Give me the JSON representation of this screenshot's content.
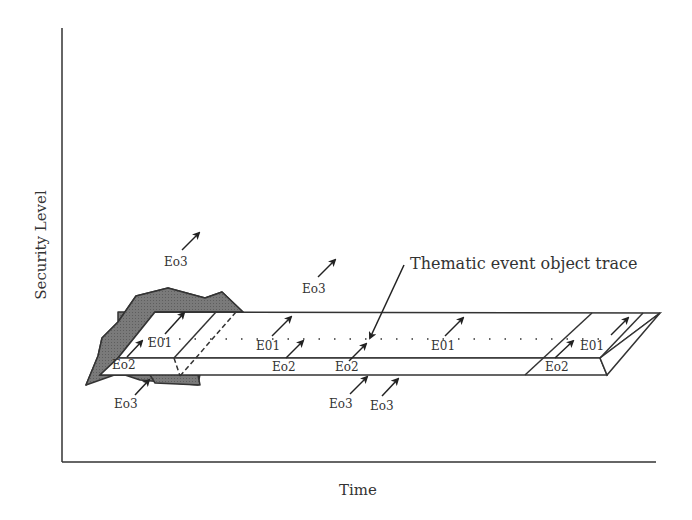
{
  "diagram": {
    "axes": {
      "y_label": "Security Level",
      "x_label": "Time"
    },
    "annotation": {
      "label": "Thematic event object trace"
    },
    "event_labels": [
      {
        "id": "e01-a",
        "text": "E01"
      },
      {
        "id": "e01-b",
        "text": "E01"
      },
      {
        "id": "e01-c",
        "text": "E01"
      },
      {
        "id": "e01-d",
        "text": "E01"
      },
      {
        "id": "eo2-a",
        "text": "Eo2"
      },
      {
        "id": "eo2-b",
        "text": "Eo2"
      },
      {
        "id": "eo2-c",
        "text": "Eo2"
      },
      {
        "id": "eo2-d",
        "text": "Eo2"
      },
      {
        "id": "eo3-a",
        "text": "Eo3"
      },
      {
        "id": "eo3-b",
        "text": "Eo3"
      },
      {
        "id": "eo3-c",
        "text": "Eo3"
      },
      {
        "id": "eo3-d",
        "text": "Eo3"
      },
      {
        "id": "eo3-e",
        "text": "Eo3"
      }
    ],
    "colors": {
      "line": "#333333",
      "region_fill": "#777777",
      "slab_fill": "#ffffff"
    }
  }
}
